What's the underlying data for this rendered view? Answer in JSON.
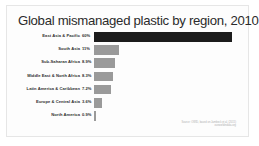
{
  "slide": {
    "title": "Global mismanaged plastic by region, 2010",
    "source_line_1": "Source: OWID, based on Jambeck et al. (2015)",
    "source_line_2": "ourworldindata.org"
  },
  "chart_data": {
    "type": "bar",
    "orientation": "horizontal",
    "title": "Global mismanaged plastic by region, 2010",
    "xlabel": "",
    "ylabel": "",
    "xlim": [
      0,
      65
    ],
    "grid": false,
    "legend": false,
    "highlight_index": 0,
    "highlight_color": "#1c1c1c",
    "bar_color": "#9a9a9a",
    "categories": [
      "East Asia & Pacific",
      "South Asia",
      "Sub-Saharan Africa",
      "Middle East & North Africa",
      "Latin America & Caribbean",
      "Europe & Central Asia",
      "North America"
    ],
    "values": [
      60,
      11,
      8.9,
      8.3,
      7.2,
      3.6,
      0.9
    ],
    "value_labels": [
      "60%",
      "11%",
      "8.9%",
      "8.3%",
      "7.2%",
      "3.6%",
      "0.9%"
    ]
  }
}
